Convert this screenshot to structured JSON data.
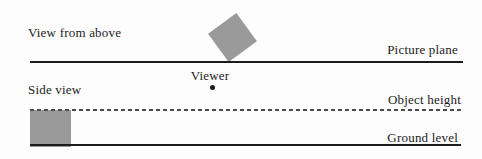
{
  "top_view": {
    "label": "View from above",
    "picture_plane_label": "Picture plane",
    "viewer_label": "Viewer"
  },
  "side_view": {
    "label": "Side view",
    "object_height_label": "Object height",
    "ground_level_label": "Ground level"
  },
  "colors": {
    "object_fill": "#9a9a9a",
    "line": "#1c1c1c",
    "dash": "#4a4a4a",
    "text": "#1c1c1c",
    "background": "#fdfdfd"
  }
}
